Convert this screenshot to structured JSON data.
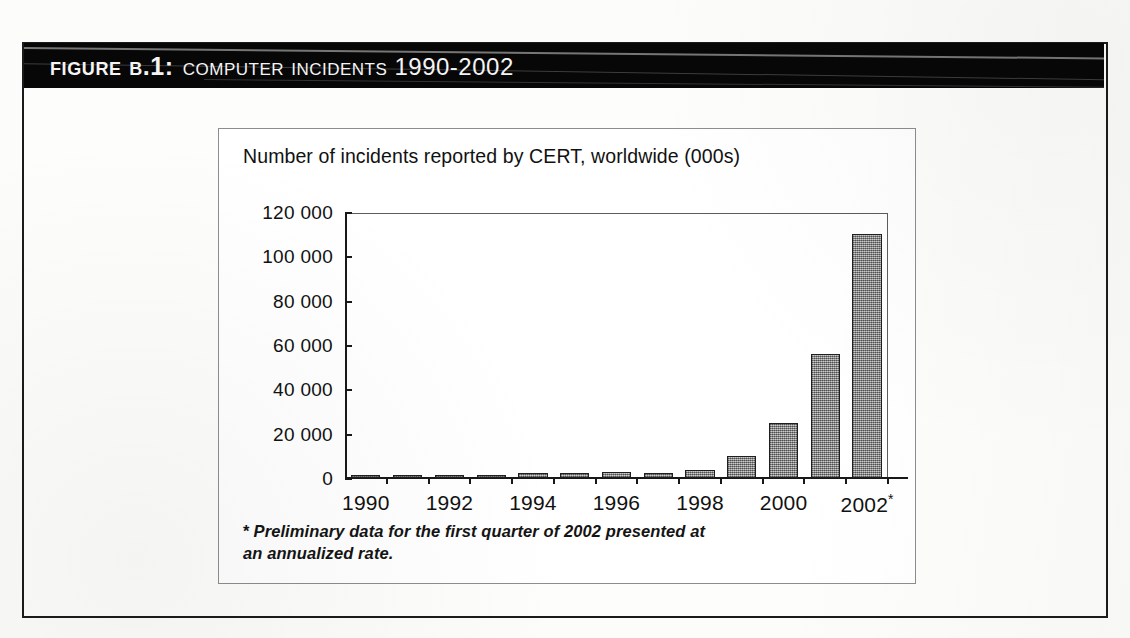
{
  "figure": {
    "label": "Figure B.1:",
    "caption": "Computer Incidents 1990-2002"
  },
  "chart_box": {
    "title": "Number of incidents reported by CERT, worldwide (000s)",
    "footnote_marker": "*",
    "footnote_line1": "Preliminary data for the first quarter of 2002 presented at",
    "footnote_line2": "an annualized rate."
  },
  "colors": {
    "banner_background": "#070707",
    "banner_text": "#f4f4f4",
    "frame_border": "#1b1b1b",
    "chart_box_border": "#8d8d8d",
    "axis": "#181818",
    "bar_fill": "#9b9b9b",
    "bar_border": "#1f1f1f",
    "page_background": "#fcfcfa"
  },
  "chart_data": {
    "type": "bar",
    "title": "Number of incidents reported by CERT, worldwide (000s)",
    "xlabel": "",
    "ylabel": "",
    "ylim": [
      0,
      120000
    ],
    "ytick_values": [
      0,
      20000,
      40000,
      60000,
      80000,
      100000,
      120000
    ],
    "ytick_labels": [
      "0",
      "20 000",
      "40 000",
      "60 000",
      "80 000",
      "100 000",
      "120 000"
    ],
    "grid": false,
    "legend": "none",
    "categories": [
      "1990",
      "1991",
      "1992",
      "1993",
      "1994",
      "1995",
      "1996",
      "1997",
      "1998",
      "1999",
      "2000",
      "2001",
      "2002*"
    ],
    "xtick_labels_shown": [
      "1990",
      "1992",
      "1994",
      "1996",
      "1998",
      "2000",
      "2002*"
    ],
    "values": [
      252,
      406,
      773,
      1334,
      2340,
      2412,
      2573,
      2134,
      3734,
      9859,
      25000,
      56000,
      110000
    ],
    "annotations": [
      "* Preliminary data for the first quarter of 2002 presented at an annualized rate."
    ]
  }
}
